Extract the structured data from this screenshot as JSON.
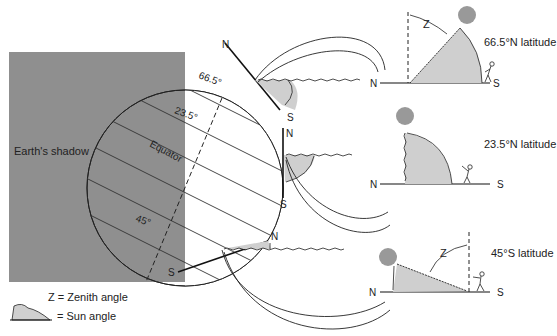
{
  "colors": {
    "shadow": "#8f8f8f",
    "sun": "#999999",
    "angle_fill": "#cfcfcf",
    "line": "#222222"
  },
  "earth": {
    "shadow_label": "Earth's shadow",
    "latitudes": {
      "lat_66": "66.5°",
      "lat_23": "23.5°",
      "equator": "Equator",
      "lat_45": "45°"
    },
    "tangent_labels": {
      "top_n": "N",
      "top_s": "S",
      "mid_n": "N",
      "mid_s": "S",
      "bot_n": "N",
      "bot_s": "S"
    }
  },
  "panels": [
    {
      "latitude_label": "66.5°N latitude",
      "north": "N",
      "south": "S",
      "zenith": "Z"
    },
    {
      "latitude_label": "23.5°N latitude",
      "north": "N",
      "south": "S"
    },
    {
      "latitude_label": "45°S latitude",
      "north": "N",
      "south": "S",
      "zenith": "Z"
    }
  ],
  "legend": {
    "zenith": "Z = Zenith angle",
    "sun": "= Sun angle"
  }
}
